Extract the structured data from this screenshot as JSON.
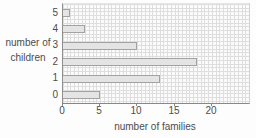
{
  "chart_data": {
    "type": "bar",
    "orientation": "horizontal",
    "title": "",
    "xlabel": "number of families",
    "ylabel": "number of children",
    "categories": [
      "5",
      "4",
      "3",
      "2",
      "1",
      "0"
    ],
    "values": [
      1,
      3,
      10,
      18,
      13,
      5
    ],
    "x_ticks": [
      0,
      5,
      10,
      15,
      20
    ],
    "xlim": [
      0,
      25
    ],
    "grid": "fine half-unit graph-paper grid",
    "legend": "none",
    "colors": {
      "bar_fill": "#e4e4e4",
      "bar_border": "#a2a2a2",
      "grid_line": "#dedede",
      "axis_line": "#878787",
      "text": "#4c4c4c",
      "background": "#fdfdfd"
    }
  }
}
